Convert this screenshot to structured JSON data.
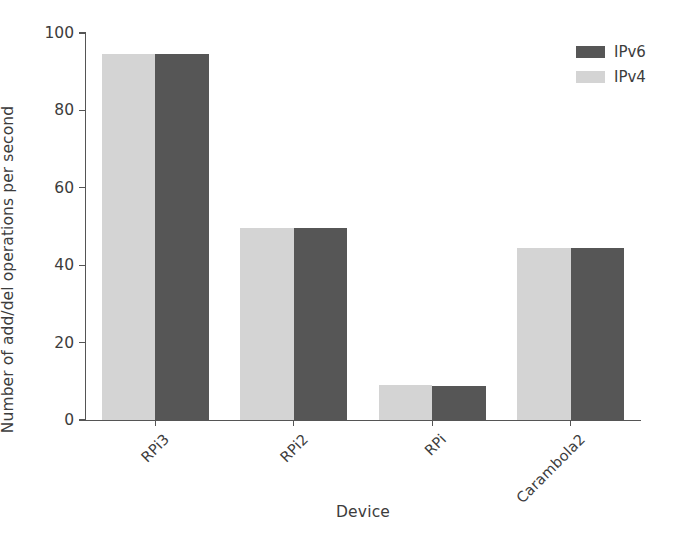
{
  "chart_data": {
    "type": "bar",
    "title": "",
    "subtitle": "",
    "xlabel": "Device",
    "ylabel": "Number of add/del operations per second",
    "categories": [
      "RPi3",
      "RPi2",
      "RPi",
      "Carambola2"
    ],
    "series": [
      {
        "name": "IPv4",
        "color": "#d4d4d4",
        "values": [
          94.5,
          49.5,
          9.0,
          44.5
        ]
      },
      {
        "name": "IPv6",
        "color": "#565656",
        "values": [
          94.5,
          49.5,
          8.7,
          44.5
        ]
      }
    ],
    "ylim": [
      0,
      100
    ],
    "yticks": [
      0,
      20,
      40,
      60,
      80,
      100
    ],
    "ytick_labels": [
      "0",
      "20",
      "40",
      "60",
      "80",
      "100"
    ],
    "xtick_labels": [
      "RPi3",
      "RPi2",
      "RPi",
      "Carambola2"
    ],
    "xtick_rotation": -45,
    "grid": false,
    "legend": {
      "position": "upper right",
      "entries": [
        {
          "label": "IPv6",
          "color": "#565656"
        },
        {
          "label": "IPv4",
          "color": "#d4d4d4"
        }
      ]
    },
    "axis_color": "#555555",
    "background": "#ffffff"
  }
}
